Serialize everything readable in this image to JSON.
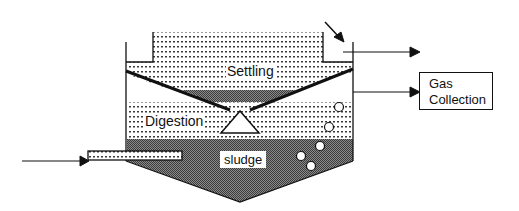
{
  "diagram": {
    "type": "anaerobic settling-digestion tank (Imhoff-style) schematic",
    "zones": {
      "settling": {
        "label": "Settling"
      },
      "digestion": {
        "label": "Digestion"
      },
      "sludge": {
        "label": "sludge"
      }
    },
    "outputs": {
      "gas_collection": {
        "line1": "Gas",
        "line2": "Collection"
      }
    },
    "flows": [
      {
        "from": "influent (left arrow)",
        "to": "inlet pipe"
      },
      {
        "from": "tank top (effluent)",
        "to": "right arrow"
      },
      {
        "from": "digestion gas",
        "to": "Gas Collection"
      }
    ],
    "colors": {
      "line": "#111111",
      "sludge_fill": "#6e6e6e",
      "dots": "#333333",
      "background": "#ffffff"
    }
  }
}
